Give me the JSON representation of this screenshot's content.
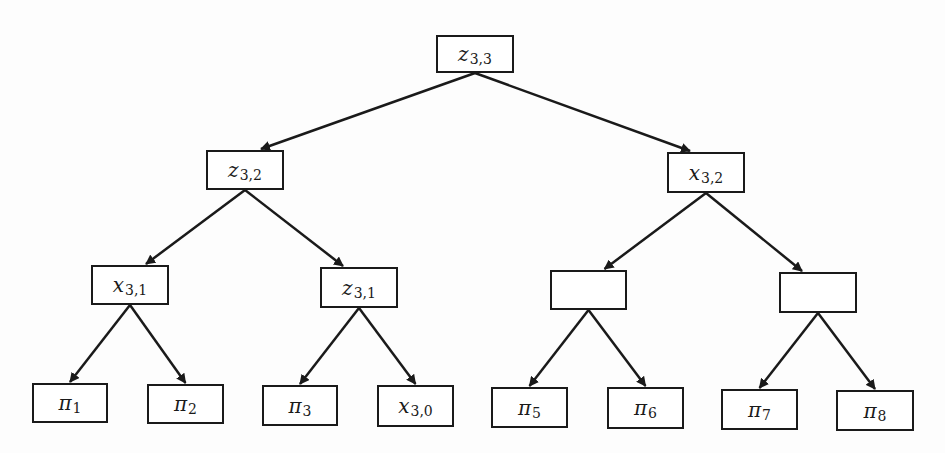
{
  "diagram": {
    "type": "binary-tree",
    "nodes": [
      {
        "id": "root",
        "base": "z",
        "sub": "3,3",
        "x": 436,
        "y": 35,
        "w": 78,
        "h": 38
      },
      {
        "id": "n_l",
        "base": "z",
        "sub": "3,2",
        "x": 206,
        "y": 150,
        "w": 78,
        "h": 40
      },
      {
        "id": "n_r",
        "base": "x",
        "sub": "3,2",
        "x": 667,
        "y": 152,
        "w": 78,
        "h": 41
      },
      {
        "id": "n_ll",
        "base": "x",
        "sub": "3,1",
        "x": 91,
        "y": 265,
        "w": 78,
        "h": 40
      },
      {
        "id": "n_lr",
        "base": "z",
        "sub": "3,1",
        "x": 320,
        "y": 267,
        "w": 78,
        "h": 41
      },
      {
        "id": "n_rl",
        "base": "",
        "sub": "",
        "x": 550,
        "y": 270,
        "w": 77,
        "h": 40
      },
      {
        "id": "n_rr",
        "base": "",
        "sub": "",
        "x": 779,
        "y": 272,
        "w": 78,
        "h": 41
      },
      {
        "id": "leaf1",
        "base": "π",
        "sub": "1",
        "x": 32,
        "y": 383,
        "w": 76,
        "h": 40
      },
      {
        "id": "leaf2",
        "base": "π",
        "sub": "2",
        "x": 147,
        "y": 384,
        "w": 77,
        "h": 40
      },
      {
        "id": "leaf3",
        "base": "π",
        "sub": "3",
        "x": 262,
        "y": 385,
        "w": 76,
        "h": 41
      },
      {
        "id": "leaf4",
        "base": "x",
        "sub": "3,0",
        "x": 377,
        "y": 385,
        "w": 77,
        "h": 42
      },
      {
        "id": "leaf5",
        "base": "π",
        "sub": "5",
        "x": 491,
        "y": 387,
        "w": 77,
        "h": 41
      },
      {
        "id": "leaf6",
        "base": "π",
        "sub": "6",
        "x": 607,
        "y": 387,
        "w": 77,
        "h": 42
      },
      {
        "id": "leaf7",
        "base": "π",
        "sub": "7",
        "x": 721,
        "y": 389,
        "w": 77,
        "h": 41
      },
      {
        "id": "leaf8",
        "base": "π",
        "sub": "8",
        "x": 836,
        "y": 390,
        "w": 78,
        "h": 41
      }
    ],
    "edges": [
      [
        "root",
        "n_l"
      ],
      [
        "root",
        "n_r"
      ],
      [
        "n_l",
        "n_ll"
      ],
      [
        "n_l",
        "n_lr"
      ],
      [
        "n_r",
        "n_rl"
      ],
      [
        "n_r",
        "n_rr"
      ],
      [
        "n_ll",
        "leaf1"
      ],
      [
        "n_ll",
        "leaf2"
      ],
      [
        "n_lr",
        "leaf3"
      ],
      [
        "n_lr",
        "leaf4"
      ],
      [
        "n_rl",
        "leaf5"
      ],
      [
        "n_rl",
        "leaf6"
      ],
      [
        "n_rr",
        "leaf7"
      ],
      [
        "n_rr",
        "leaf8"
      ]
    ],
    "edge_target_offsets": {
      "n_l": -16,
      "n_r": -16,
      "n_ll": -16,
      "n_lr": 16,
      "n_rl": -16,
      "n_rr": 16,
      "leaf1": 0,
      "leaf2": 0,
      "leaf3": 0,
      "leaf4": 0,
      "leaf5": 0,
      "leaf6": 0,
      "leaf7": 0,
      "leaf8": 0
    },
    "colors": {
      "stroke": "#1a1a1a",
      "fill": "#ffffff",
      "background": "#fdfdfd"
    }
  }
}
